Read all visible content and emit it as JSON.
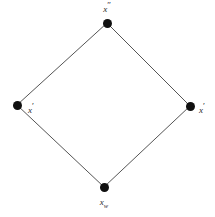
{
  "figure": {
    "type": "lattice-diagram",
    "width": 215,
    "height": 217,
    "background_color": "#ffffff",
    "node_color": "#101010",
    "edge_color": "#555555",
    "label_color": "#2a2a2a"
  },
  "nodes": [
    {
      "id": "top",
      "label_base": "x",
      "label_prime": "″",
      "label_sub": "",
      "label_text": "x″",
      "x": 107,
      "y": 23,
      "label_x": 107,
      "label_y": 14,
      "label_position": "above"
    },
    {
      "id": "left",
      "label_base": "x",
      "label_prime": "′",
      "label_sub": "",
      "label_text": "x′",
      "x": 17,
      "y": 105,
      "label_x": 28,
      "label_y": 108,
      "label_position": "right"
    },
    {
      "id": "right",
      "label_base": "x",
      "label_prime": "′",
      "label_sub": "",
      "label_text": "x′",
      "x": 190,
      "y": 106,
      "label_x": 199,
      "label_y": 108,
      "label_position": "right"
    },
    {
      "id": "bottom",
      "label_base": "x",
      "label_prime": "",
      "label_sub": "w",
      "label_text": "xᵥ",
      "x": 104,
      "y": 187,
      "label_x": 104,
      "label_y": 198,
      "label_position": "below"
    }
  ],
  "edges": [
    {
      "id": "left-top",
      "from": "left",
      "to": "top"
    },
    {
      "id": "top-right",
      "from": "top",
      "to": "right"
    },
    {
      "id": "left-bottom",
      "from": "left",
      "to": "bottom"
    },
    {
      "id": "bottom-right",
      "from": "bottom",
      "to": "right"
    }
  ]
}
